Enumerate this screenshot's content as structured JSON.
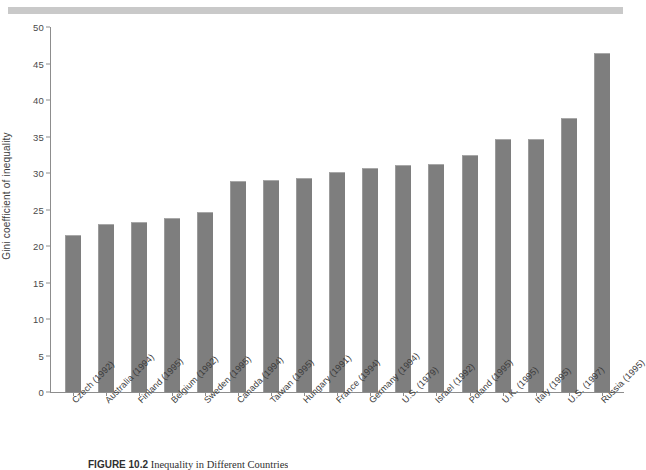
{
  "figure": {
    "caption_label": "FIGURE 10.2",
    "caption_text": "Inequality in Different Countries",
    "top_band": "#c9c9c9"
  },
  "chart_data": {
    "type": "bar",
    "title": "",
    "xlabel": "",
    "ylabel": "Gini coefficient of inequality",
    "ylim": [
      0,
      50
    ],
    "ytick_step": 5,
    "yticks": [
      "0",
      "5",
      "10",
      "15",
      "20",
      "25",
      "30",
      "35",
      "40",
      "45",
      "50"
    ],
    "grid": false,
    "legend": "none",
    "bar_color": "#7e7e7e",
    "categories": [
      "Czech (1992)",
      "Australia (1994)",
      "Finland (1995)",
      "Belgium (1992)",
      "Sweden (1995)",
      "Canada (1994)",
      "Taiwan (1995)",
      "Hungary (1991)",
      "France (1994)",
      "Germany (1994)",
      "U.S. (1979)",
      "Israel (1992)",
      "Poland (1995)",
      "U.K. (1995)",
      "Italy (1995)",
      "U.S. (1997)",
      "Russia (1995)"
    ],
    "values": [
      21.5,
      23.0,
      23.3,
      23.8,
      24.7,
      28.9,
      29.0,
      29.3,
      30.2,
      30.7,
      31.1,
      31.3,
      32.4,
      34.7,
      34.7,
      37.5,
      46.5
    ]
  }
}
